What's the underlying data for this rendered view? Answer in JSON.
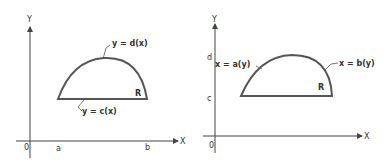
{
  "left_panel": {
    "y_axis_label": "Y",
    "x_axis_label": "X",
    "origin_label": "0",
    "tick_a": "a",
    "tick_b": "b",
    "upper_curve_label": "y = d(x)",
    "lower_curve_label": "y = c(x)",
    "region_label": "R"
  },
  "right_panel": {
    "y_axis_label": "Y",
    "x_axis_label": "X",
    "origin_label": "0",
    "tick_c": "c",
    "tick_d": "d",
    "left_curve_label": "x = a(y)",
    "right_curve_label": "x = b(y)",
    "region_label": "R"
  }
}
